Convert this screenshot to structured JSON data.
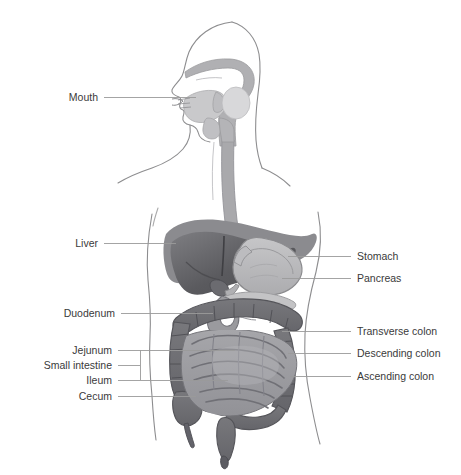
{
  "diagram": {
    "background_color": "#ffffff",
    "style": "grayscale anatomical illustration with leader-line callouts",
    "text_color": "#3a3a3a",
    "leader_color": "#9a9a9a",
    "palette": {
      "body_outline": "#8d8d8f",
      "liver_dark": "#56565a",
      "liver_mid": "#7e7e82",
      "liver_rim": "#8f8f93",
      "stomach_fill": "#b9b9bb",
      "stomach_edge": "#8b8b8e",
      "esophagus": "#a9a9ac",
      "colon_fill": "#6f6f73",
      "colon_edge": "#57575b",
      "small_intestine_fill": "#9d9da1",
      "small_intestine_edge": "#75757a",
      "pancreas": "#c3c3c5",
      "head_cavity": "#b0b0b3",
      "tongue": "#c9c9cb"
    },
    "labels_left": [
      {
        "id": "mouth",
        "text": "Mouth",
        "text_x": 98,
        "text_y": 97,
        "line_x1": 104,
        "line_x2": 196,
        "line_y": 97
      },
      {
        "id": "liver",
        "text": "Liver",
        "text_x": 98,
        "text_y": 243,
        "line_x1": 104,
        "line_x2": 176,
        "line_y": 243
      },
      {
        "id": "duodenum",
        "text": "Duodenum",
        "text_x": 115,
        "text_y": 313,
        "line_x1": 121,
        "line_x2": 213,
        "line_y": 313
      },
      {
        "id": "jejunum",
        "text": "Jejunum",
        "text_x": 112,
        "text_y": 350,
        "line_x1": 118,
        "line_x2": 235,
        "line_y": 350
      },
      {
        "id": "small-intestine",
        "text": "Small intestine",
        "text_x": 112,
        "text_y": 365,
        "line_x1": 118,
        "line_x2": 140,
        "line_y": 365
      },
      {
        "id": "ileum",
        "text": "Ileum",
        "text_x": 112,
        "text_y": 380,
        "line_x1": 118,
        "line_x2": 228,
        "line_y": 380
      },
      {
        "id": "cecum",
        "text": "Cecum",
        "text_x": 112,
        "text_y": 396,
        "line_x1": 118,
        "line_x2": 196,
        "line_y": 396
      }
    ],
    "bracket": {
      "id": "small-intestine-bracket",
      "x": 140,
      "y_top": 350,
      "y_bottom": 380
    },
    "labels_right": [
      {
        "id": "stomach",
        "text": "Stomach",
        "text_x": 357,
        "text_y": 256,
        "line_x1": 288,
        "line_x2": 351,
        "line_y": 256
      },
      {
        "id": "pancreas",
        "text": "Pancreas",
        "text_x": 357,
        "text_y": 278,
        "line_x1": 282,
        "line_x2": 351,
        "line_y": 278
      },
      {
        "id": "transverse-colon",
        "text": "Transverse colon",
        "text_x": 357,
        "text_y": 331,
        "line_x1": 282,
        "line_x2": 351,
        "line_y": 331
      },
      {
        "id": "descending-colon",
        "text": "Descending colon",
        "text_x": 357,
        "text_y": 353,
        "line_x1": 288,
        "line_x2": 351,
        "line_y": 353
      },
      {
        "id": "ascending-colon",
        "text": "Ascending colon",
        "text_x": 357,
        "text_y": 376,
        "line_x1": 290,
        "line_x2": 351,
        "line_y": 376
      }
    ],
    "organs": [
      "mouth",
      "esophagus",
      "stomach",
      "liver",
      "pancreas",
      "duodenum",
      "jejunum",
      "ileum",
      "cecum",
      "ascending colon",
      "transverse colon",
      "descending colon",
      "rectum"
    ]
  }
}
